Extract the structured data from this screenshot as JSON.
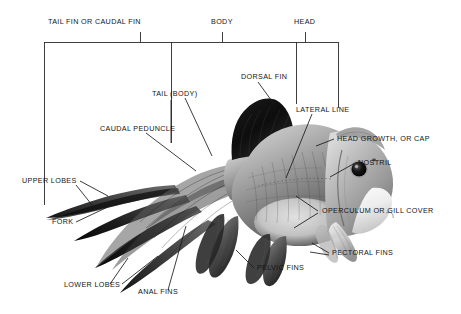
{
  "diagram": {
    "background_color": "#ffffff",
    "line_color": "#1a1a1a",
    "text_color": "#151515"
  },
  "bracket": {
    "description": "top bracket dividing the fish into three body regions",
    "segments": [
      {
        "label": "TAIL FIN OR CAUDAL FIN",
        "text_x": 48,
        "text_y": 22,
        "tick_x": 140,
        "left_x": 44,
        "right_x": 171
      },
      {
        "label": "BODY",
        "text_x": 211,
        "text_y": 22,
        "tick_x": 222,
        "left_x": 171,
        "right_x": 296
      },
      {
        "label": "HEAD",
        "text_x": 294,
        "text_y": 22,
        "tick_x": 305,
        "left_x": 296,
        "right_x": 338
      }
    ],
    "rail_y": 42,
    "tick_top_y": 31
  },
  "callouts": [
    {
      "name": "tail-body",
      "label": "TAIL (BODY)",
      "text_x": 152,
      "text_y": 94,
      "align": "right"
    },
    {
      "name": "dorsal-fin",
      "label": "DORSAL FIN",
      "text_x": 241,
      "text_y": 77,
      "align": "left"
    },
    {
      "name": "lateral-line",
      "label": "LATERAL LINE",
      "text_x": 296,
      "text_y": 110,
      "align": "left"
    },
    {
      "name": "caudal-peduncle",
      "label": "CAUDAL PEDUNCLE",
      "text_x": 100,
      "text_y": 129,
      "align": "left"
    },
    {
      "name": "head-growth-cap",
      "label": "HEAD GROWTH, OR CAP",
      "text_x": 337,
      "text_y": 141,
      "align": "left"
    },
    {
      "name": "nostril",
      "label": "NOSTRIL",
      "text_x": 358,
      "text_y": 166,
      "align": "left"
    },
    {
      "name": "upper-lobes",
      "label": "UPPER LOBES",
      "text_x": 22,
      "text_y": 182,
      "align": "left"
    },
    {
      "name": "fork",
      "label": "FORK",
      "text_x": 52,
      "text_y": 226,
      "align": "left"
    },
    {
      "name": "operculum",
      "label": "OPERCULUM OR GILL COVER",
      "text_x": 322,
      "text_y": 214,
      "align": "left"
    },
    {
      "name": "pectoral-fins",
      "label": "PECTORAL FINS",
      "text_x": 332,
      "text_y": 256,
      "align": "left"
    },
    {
      "name": "pelvic-fins",
      "label": "PELVIC FINS",
      "text_x": 257,
      "text_y": 271,
      "align": "left"
    },
    {
      "name": "lower-lobes",
      "label": "LOWER LOBES",
      "text_x": 64,
      "text_y": 288,
      "align": "left"
    },
    {
      "name": "anal-fins",
      "label": "ANAL FINS",
      "text_x": 138,
      "text_y": 295,
      "align": "left"
    }
  ]
}
